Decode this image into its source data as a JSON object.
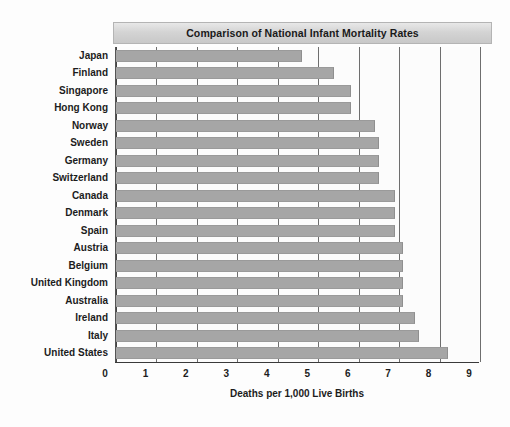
{
  "chart_data": {
    "type": "bar",
    "orientation": "horizontal",
    "title": "Comparison of National Infant Mortality Rates",
    "xlabel": "Deaths per 1,000 Live Births",
    "ylabel": "",
    "xlim": [
      0,
      9
    ],
    "xticks": [
      "0",
      "1",
      "2",
      "3",
      "4",
      "5",
      "6",
      "7",
      "8",
      "9"
    ],
    "grid": true,
    "legend": false,
    "bar_color": "#a6a6a6",
    "categories": [
      "Japan",
      "Finland",
      "Singapore",
      "Hong Kong",
      "Norway",
      "Sweden",
      "Germany",
      "Switzerland",
      "Canada",
      "Denmark",
      "Spain",
      "Austria",
      "Belgium",
      "United Kingdom",
      "Australia",
      "Ireland",
      "Italy",
      "United States"
    ],
    "values": [
      4.6,
      5.4,
      5.8,
      5.8,
      6.4,
      6.5,
      6.5,
      6.5,
      6.9,
      6.9,
      6.9,
      7.1,
      7.1,
      7.1,
      7.1,
      7.4,
      7.5,
      8.2
    ]
  }
}
